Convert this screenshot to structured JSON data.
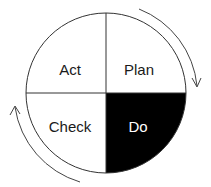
{
  "diagram": {
    "quadrants": [
      {
        "label": "Act",
        "position": "top-left",
        "fill": "#ffffff",
        "text_color": "#1a1a1a"
      },
      {
        "label": "Plan",
        "position": "top-right",
        "fill": "#ffffff",
        "text_color": "#1a1a1a"
      },
      {
        "label": "Check",
        "position": "bottom-left",
        "fill": "#ffffff",
        "text_color": "#1a1a1a"
      },
      {
        "label": "Do",
        "position": "bottom-right",
        "fill": "#000000",
        "text_color": "#ffffff"
      }
    ],
    "arrows": [
      {
        "position": "top-right",
        "direction": "clockwise-down"
      },
      {
        "position": "bottom-left",
        "direction": "clockwise-up"
      }
    ]
  }
}
